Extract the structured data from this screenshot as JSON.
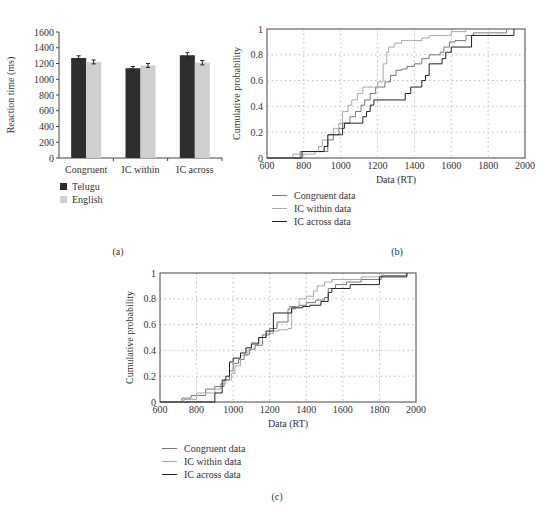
{
  "chart_data": [
    {
      "panel": "(a)",
      "type": "bar",
      "title": "",
      "xlabel": "",
      "ylabel": "Reaction time (ms)",
      "ylim": [
        0,
        1600
      ],
      "yticks": [
        0,
        200,
        400,
        600,
        800,
        1000,
        1200,
        1400,
        1600
      ],
      "categories": [
        "Congruent",
        "IC within",
        "IC across"
      ],
      "series": [
        {
          "name": "Telugu",
          "color": "#2e2e2e",
          "values": [
            1270,
            1140,
            1305
          ],
          "errors": [
            55,
            45,
            65
          ]
        },
        {
          "name": "English",
          "color": "#cfcfcf",
          "values": [
            1220,
            1175,
            1210
          ],
          "errors": [
            50,
            50,
            55
          ]
        }
      ],
      "legend_position": "below-left",
      "grid": false
    },
    {
      "panel": "(b)",
      "type": "line",
      "title": "",
      "xlabel": "Data (RT)",
      "ylabel": "Cumulative probability",
      "xlim": [
        600,
        2000
      ],
      "ylim": [
        0,
        1
      ],
      "xticks": [
        600,
        800,
        1000,
        1200,
        1400,
        1600,
        1800,
        2000
      ],
      "yticks": [
        0,
        0.2,
        0.4,
        0.6,
        0.8,
        1
      ],
      "grid": true,
      "legend_position": "below",
      "series": [
        {
          "name": "Congruent data",
          "color": "#777777",
          "x": [
            780,
            910,
            930,
            960,
            990,
            1010,
            1050,
            1080,
            1110,
            1130,
            1160,
            1190,
            1240,
            1270,
            1300,
            1330,
            1360,
            1400,
            1440,
            1480,
            1540,
            1560,
            1590,
            1620,
            1680,
            1720,
            1900
          ],
          "y": [
            0.05,
            0.05,
            0.14,
            0.18,
            0.23,
            0.27,
            0.32,
            0.36,
            0.41,
            0.45,
            0.5,
            0.55,
            0.59,
            0.64,
            0.68,
            0.69,
            0.71,
            0.73,
            0.77,
            0.8,
            0.82,
            0.86,
            0.9,
            0.91,
            0.95,
            0.97,
            1.0
          ]
        },
        {
          "name": "IC within data",
          "color": "#a8a8a8",
          "x": [
            740,
            860,
            880,
            900,
            930,
            960,
            990,
            1010,
            1040,
            1060,
            1090,
            1120,
            1140,
            1200,
            1230,
            1250,
            1260,
            1290,
            1330,
            1380,
            1440,
            1480,
            1540,
            1600,
            1680
          ],
          "y": [
            0.03,
            0.05,
            0.09,
            0.14,
            0.18,
            0.23,
            0.27,
            0.36,
            0.41,
            0.45,
            0.5,
            0.55,
            0.55,
            0.59,
            0.73,
            0.82,
            0.86,
            0.89,
            0.91,
            0.91,
            0.93,
            0.95,
            0.95,
            0.98,
            1.0
          ]
        },
        {
          "name": "IC across data",
          "color": "#222222",
          "x": [
            790,
            910,
            930,
            1010,
            1020,
            1080,
            1120,
            1140,
            1160,
            1180,
            1330,
            1350,
            1380,
            1440,
            1460,
            1480,
            1550,
            1570,
            1600,
            1710,
            1940
          ],
          "y": [
            0.05,
            0.09,
            0.18,
            0.23,
            0.27,
            0.27,
            0.32,
            0.36,
            0.41,
            0.45,
            0.45,
            0.5,
            0.55,
            0.6,
            0.64,
            0.73,
            0.77,
            0.82,
            0.86,
            0.95,
            1.0
          ]
        }
      ]
    },
    {
      "panel": "(c)",
      "type": "line",
      "title": "",
      "xlabel": "Data (RT)",
      "ylabel": "Cumulative probability",
      "xlim": [
        600,
        2000
      ],
      "ylim": [
        0,
        1
      ],
      "xticks": [
        600,
        800,
        1000,
        1200,
        1400,
        1600,
        1800,
        2000
      ],
      "yticks": [
        0,
        0.2,
        0.4,
        0.6,
        0.8,
        1
      ],
      "grid": true,
      "legend_position": "below",
      "series": [
        {
          "name": "Congruent data",
          "color": "#777777",
          "x": [
            720,
            770,
            850,
            900,
            950,
            980,
            1000,
            1030,
            1060,
            1090,
            1120,
            1160,
            1200,
            1240,
            1300,
            1310,
            1360,
            1400,
            1450,
            1500,
            1520,
            1560,
            1620,
            1700,
            1810,
            1950
          ],
          "y": [
            0.03,
            0.05,
            0.1,
            0.12,
            0.17,
            0.24,
            0.3,
            0.33,
            0.37,
            0.41,
            0.44,
            0.52,
            0.57,
            0.62,
            0.72,
            0.74,
            0.75,
            0.77,
            0.79,
            0.81,
            0.88,
            0.91,
            0.93,
            0.95,
            0.98,
            1.0
          ]
        },
        {
          "name": "IC within data",
          "color": "#a8a8a8",
          "x": [
            730,
            800,
            900,
            930,
            960,
            990,
            1010,
            1040,
            1080,
            1100,
            1140,
            1180,
            1220,
            1250,
            1300,
            1320,
            1340,
            1360,
            1400,
            1440,
            1460,
            1500,
            1540,
            1700,
            1820
          ],
          "y": [
            0.02,
            0.07,
            0.1,
            0.14,
            0.17,
            0.22,
            0.28,
            0.36,
            0.4,
            0.46,
            0.5,
            0.53,
            0.55,
            0.56,
            0.57,
            0.72,
            0.74,
            0.8,
            0.82,
            0.86,
            0.9,
            0.93,
            0.95,
            0.97,
            1.0
          ]
        },
        {
          "name": "IC across data",
          "color": "#222222",
          "x": [
            900,
            940,
            960,
            980,
            1000,
            1040,
            1070,
            1100,
            1140,
            1180,
            1220,
            1300,
            1320,
            1380,
            1420,
            1480,
            1520,
            1540,
            1640,
            1800,
            1950
          ],
          "y": [
            0.07,
            0.17,
            0.2,
            0.31,
            0.34,
            0.38,
            0.42,
            0.45,
            0.5,
            0.55,
            0.69,
            0.69,
            0.73,
            0.74,
            0.75,
            0.78,
            0.85,
            0.88,
            0.91,
            0.97,
            1.0
          ]
        }
      ]
    }
  ],
  "captions": {
    "a": "(a)",
    "b": "(b)",
    "c": "(c)"
  }
}
